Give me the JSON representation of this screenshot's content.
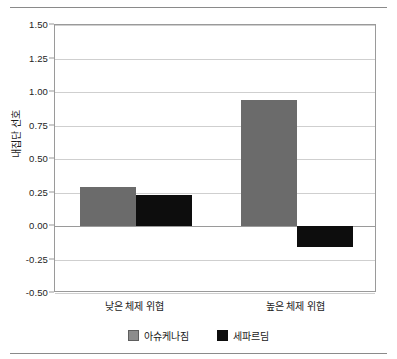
{
  "chart_data": {
    "type": "bar",
    "title": "",
    "xlabel": "",
    "ylabel": "내집단 선호",
    "categories": [
      "낮은 체제 위협",
      "높은 체제 위협"
    ],
    "series": [
      {
        "name": "아슈케나짐",
        "color": "#6b6b6b",
        "values": [
          0.29,
          0.94
        ]
      },
      {
        "name": "세파르딤",
        "color": "#0d0d0d",
        "values": [
          0.23,
          -0.16
        ]
      }
    ],
    "ylim": [
      -0.5,
      1.5
    ],
    "ytick_labels": [
      "1.50",
      "1.25",
      "1.00",
      "0.75",
      "0.50",
      "0.25",
      "0.00",
      "-0.25",
      "-0.50"
    ],
    "ytick_values": [
      1.5,
      1.25,
      1.0,
      0.75,
      0.5,
      0.25,
      0.0,
      -0.25,
      -0.5
    ],
    "grid": true,
    "legend_position": "bottom",
    "zero_line": 0.0
  }
}
